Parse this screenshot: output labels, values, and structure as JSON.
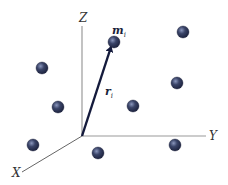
{
  "diagram": {
    "type": "3d-coordinate-system-particles",
    "origin": {
      "x": 82,
      "y": 136
    },
    "axes": [
      {
        "name": "z-axis",
        "label": "Z",
        "x1": 82,
        "y1": 136,
        "x2": 82,
        "y2": 26,
        "lx": 79,
        "ly": 22
      },
      {
        "name": "y-axis",
        "label": "Y",
        "x1": 82,
        "y1": 136,
        "x2": 206,
        "y2": 136,
        "lx": 209,
        "ly": 140
      },
      {
        "name": "x-axis",
        "label": "X",
        "x1": 82,
        "y1": 136,
        "x2": 22,
        "y2": 172,
        "lx": 12,
        "ly": 177
      }
    ],
    "vector": {
      "label": "r",
      "subscript": "i",
      "x1": 82,
      "y1": 136,
      "x2": 111,
      "y2": 47,
      "lx": 105,
      "ly": 95
    },
    "mass_label": {
      "label": "m",
      "subscript": "i",
      "lx": 112,
      "ly": 34
    },
    "particles": [
      {
        "id": "m-i",
        "cx": 114,
        "cy": 42
      },
      {
        "id": "p2",
        "cx": 183,
        "cy": 32
      },
      {
        "id": "p3",
        "cx": 42,
        "cy": 68
      },
      {
        "id": "p4",
        "cx": 177,
        "cy": 83
      },
      {
        "id": "p5",
        "cx": 58,
        "cy": 107
      },
      {
        "id": "p6",
        "cx": 133,
        "cy": 106
      },
      {
        "id": "p7",
        "cx": 33,
        "cy": 145
      },
      {
        "id": "p8",
        "cx": 98,
        "cy": 153
      },
      {
        "id": "p9",
        "cx": 175,
        "cy": 145
      }
    ],
    "particle_radius": 6,
    "colors": {
      "axis": "#9a9a9a",
      "axis_x": "#555555",
      "vector": "#141a3c",
      "particle_dark": "#1e2440",
      "particle_mid": "#3a4468",
      "particle_light": "#8a96bc"
    }
  }
}
